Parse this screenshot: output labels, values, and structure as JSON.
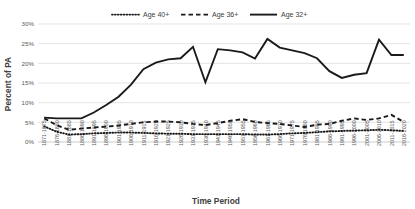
{
  "chart_data": {
    "type": "line",
    "title": "",
    "xlabel": "Time Period",
    "ylabel": "Percent of PA",
    "ylim": [
      0,
      30
    ],
    "ytick_labels": [
      "0%",
      "5%",
      "10%",
      "15%",
      "20%",
      "25%",
      "30%"
    ],
    "ytick_values": [
      0,
      5,
      10,
      15,
      20,
      25,
      30
    ],
    "grid": true,
    "legend_position": "top-center",
    "categories": [
      "1871-1875",
      "1876-1880",
      "1881-1885",
      "1886-1890",
      "1891-1895",
      "1896-1900",
      "1901-1905",
      "1906-1910",
      "1911-1915",
      "1916-1920",
      "1921-1925",
      "1926-1930",
      "1931-1935",
      "1936-1940",
      "1941-1945",
      "1946-1950",
      "1951-1955",
      "1956-1960",
      "1961-1965",
      "1966-1970",
      "1971-1975",
      "1976-1980",
      "1981-1985",
      "1986-1990",
      "1991-1995",
      "1996-2000",
      "2001-2005",
      "2006-2010",
      "2011-2015",
      "2016-2020"
    ],
    "series": [
      {
        "name": "Age 40+",
        "style": "dotted",
        "color": "#1a1a1a",
        "values": [
          4.0,
          2.6,
          1.9,
          2.0,
          2.2,
          2.3,
          2.4,
          2.4,
          2.3,
          2.2,
          2.1,
          2.1,
          2.0,
          2.0,
          2.0,
          2.0,
          2.0,
          1.9,
          1.9,
          2.0,
          2.2,
          2.3,
          2.5,
          2.7,
          2.8,
          2.9,
          3.0,
          3.1,
          3.0,
          2.8
        ]
      },
      {
        "name": "Age 36+",
        "style": "dashed",
        "color": "#1a1a1a",
        "values": [
          6.0,
          4.3,
          3.1,
          3.4,
          3.7,
          3.9,
          4.2,
          4.6,
          5.0,
          5.2,
          5.2,
          5.0,
          4.6,
          4.3,
          4.8,
          5.4,
          5.8,
          5.1,
          4.8,
          4.6,
          4.2,
          3.8,
          4.4,
          4.6,
          5.4,
          6.0,
          5.6,
          6.0,
          6.9,
          5.1
        ]
      },
      {
        "name": "Age 32+",
        "style": "solid",
        "color": "#1a1a1a",
        "values": [
          6.2,
          6.0,
          6.0,
          6.0,
          7.5,
          9.4,
          11.5,
          14.6,
          18.5,
          20.2,
          21.0,
          21.3,
          24.2,
          15.2,
          23.6,
          23.3,
          22.8,
          21.2,
          26.2,
          24.0,
          23.3,
          22.6,
          21.3,
          18.0,
          16.3,
          17.1,
          17.5,
          26.0,
          22.1,
          22.1
        ]
      }
    ]
  },
  "legend": {
    "entries": [
      {
        "label": "Age 40+",
        "style": "dotted"
      },
      {
        "label": "Age 36+",
        "style": "dashed"
      },
      {
        "label": "Age 32+",
        "style": "solid"
      }
    ]
  }
}
